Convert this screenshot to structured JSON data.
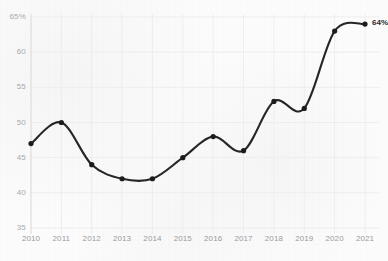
{
  "chart_data": {
    "type": "line",
    "title": "",
    "subtitle": "",
    "xlabel": "",
    "ylabel": "",
    "categories": [
      "2010",
      "2011",
      "2012",
      "2013",
      "2014",
      "2015",
      "2016",
      "2017",
      "2018",
      "2019",
      "2020",
      "2021"
    ],
    "values": [
      47,
      50,
      44,
      42,
      42,
      45,
      48,
      46,
      53,
      52,
      63,
      64
    ],
    "x": [
      2010,
      2011,
      2012,
      2013,
      2014,
      2015,
      2016,
      2017,
      2018,
      2019,
      2020,
      2021
    ],
    "ylim": [
      35,
      65
    ],
    "xlim": [
      2010,
      2021
    ],
    "ytick_labels": [
      "65%",
      "60",
      "55",
      "50",
      "45",
      "40",
      "35"
    ],
    "ytick_values": [
      65,
      60,
      55,
      50,
      45,
      40,
      35
    ],
    "xtick_labels": [
      "2010",
      "2011",
      "2012",
      "2013",
      "2014",
      "2015",
      "2016",
      "2017",
      "2018",
      "2019",
      "2020",
      "2021"
    ],
    "grid": true,
    "legend": "none",
    "line_color": "#262626",
    "marker_color": "#1c1c1c",
    "grid_color": "#eeeeef",
    "background_color": "#fcfcfc",
    "annotations": [
      {
        "name": "end-value-label",
        "text": "64%",
        "x": 2021,
        "y": 64
      }
    ]
  }
}
